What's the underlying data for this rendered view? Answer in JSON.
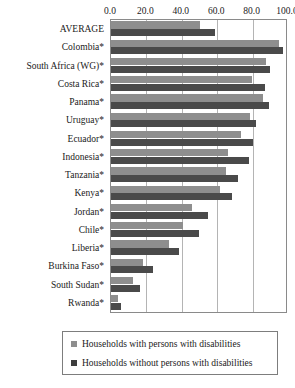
{
  "chart_data": {
    "type": "bar",
    "orientation": "horizontal",
    "title": "",
    "xlabel": "",
    "ylabel": "",
    "xlim": [
      0,
      100
    ],
    "xticks": [
      "0.0",
      "20.0",
      "40.0",
      "60.0",
      "80.0",
      "100.0"
    ],
    "xtick_values": [
      0,
      20,
      40,
      60,
      80,
      100
    ],
    "grid": true,
    "legend_position": "bottom",
    "categories": [
      "AVERAGE",
      "Colombia*",
      "South Africa (WG)*",
      "Costa Rica*",
      "Panama*",
      "Uruguay*",
      "Ecuador*",
      "Indonesia*",
      "Tanzania*",
      "Kenya*",
      "Jordan*",
      "Chile*",
      "Liberia*",
      "Burkina Faso*",
      "South Sudan*",
      "Rwanda*"
    ],
    "series": [
      {
        "name": "Households with persons with disabilities",
        "color": "#8e8e8e",
        "values": [
          51.0,
          96.0,
          88.5,
          80.5,
          87.0,
          79.5,
          74.5,
          67.0,
          65.5,
          62.5,
          46.5,
          41.0,
          33.0,
          18.5,
          12.5,
          4.0
        ]
      },
      {
        "name": "Households without persons with disabilities",
        "color": "#4a4a4a",
        "values": [
          59.5,
          98.5,
          91.0,
          88.0,
          90.5,
          83.0,
          81.0,
          79.0,
          72.5,
          69.0,
          55.5,
          50.5,
          39.0,
          24.0,
          16.5,
          5.5
        ]
      }
    ]
  },
  "legend": {
    "items": [
      {
        "label": "Households with persons with disabilities"
      },
      {
        "label": "Households without persons with disabilities"
      }
    ]
  },
  "colors": {
    "series_with_disabilities": "#8e8e8e",
    "series_without_disabilities": "#4a4a4a",
    "gridline": "#b4b4b4",
    "frame": "#8a8a8a",
    "text": "#1a1a1a",
    "background": "#ffffff"
  }
}
